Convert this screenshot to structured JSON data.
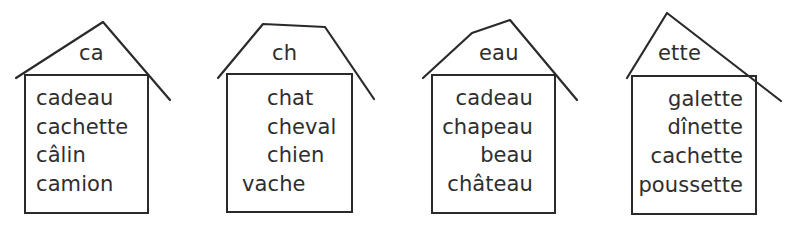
{
  "houses": [
    {
      "roof_label": "ca",
      "words": [
        "cadeau",
        "cachette",
        "câlin",
        "camion"
      ]
    },
    {
      "roof_label": "ch",
      "words": [
        "chat",
        "cheval",
        "chien",
        "vache"
      ]
    },
    {
      "roof_label": "eau",
      "words": [
        "cadeau",
        "chapeau",
        "beau",
        "château"
      ]
    },
    {
      "roof_label": "ette",
      "words": [
        "galette",
        "dînette",
        "cachette",
        "poussette"
      ]
    }
  ],
  "colors": {
    "line": "#2a2a2a",
    "text": "#2e2e2e",
    "background": "#ffffff"
  }
}
